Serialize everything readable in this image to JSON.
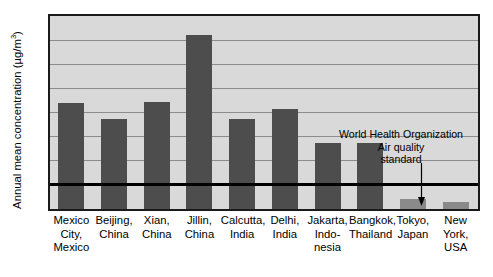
{
  "chart_data": {
    "type": "bar",
    "title": "",
    "xlabel": "",
    "ylabel": "Annual mean concentration (µg/m",
    "ylabel_sup": "3",
    "ylabel_tail": ")",
    "ylim": [
      0,
      800
    ],
    "ytick_step": 100,
    "yticks": [
      "800",
      "700",
      "600",
      "500",
      "400",
      "300",
      "200",
      "100",
      "0"
    ],
    "grid": true,
    "legend": "none",
    "categories": [
      "Mexico City, Mexico",
      "Beijing, China",
      "Xian, China",
      "Jillin, China",
      "Calcutta, India",
      "Delhi, India",
      "Jakarta, Indonesia",
      "Bangkok, Thailand",
      "Tokyo, Japan",
      "New York, USA"
    ],
    "category_label_lines": [
      [
        "Mexico",
        "City,",
        "Mexico"
      ],
      [
        "Beijing,",
        "China"
      ],
      [
        "Xian,",
        "China"
      ],
      [
        "Jillin,",
        "China"
      ],
      [
        "Calcutta,",
        "India"
      ],
      [
        "Delhi,",
        "India"
      ],
      [
        "Jakarta,",
        "Indo-",
        "nesia"
      ],
      [
        "Bangkok,",
        "Thailand"
      ],
      [
        "Tokyo,",
        "Japan"
      ],
      [
        "New",
        "York,",
        "USA"
      ]
    ],
    "values": [
      440,
      377,
      445,
      725,
      373,
      415,
      273,
      275,
      40,
      30
    ],
    "bar_colors": [
      "#4d4d4d",
      "#4d4d4d",
      "#4d4d4d",
      "#4d4d4d",
      "#4d4d4d",
      "#4d4d4d",
      "#4d4d4d",
      "#4d4d4d",
      "#8a8a8a",
      "#8a8a8a"
    ],
    "annotations": [
      {
        "name": "who-standard",
        "lines": [
          "World Health Organization",
          "Air quality",
          "standard"
        ],
        "value": 100,
        "style": "horizontal reference line with downward arrow"
      }
    ]
  },
  "colors": {
    "plot_background": "#d9d9d9",
    "bar_dark": "#4d4d4d",
    "bar_light": "#8a8a8a",
    "gridline": "#8c8c8c",
    "frame": "#1a1a1a",
    "reference_line": "#000000",
    "text": "#000000"
  }
}
